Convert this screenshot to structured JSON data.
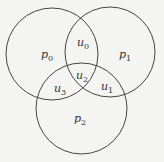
{
  "diagram": {
    "type": "venn",
    "stroke_color": "#444444",
    "background": "#f4f4f2",
    "circles": [
      {
        "name": "left",
        "cx": 52,
        "cy": 54,
        "r": 46
      },
      {
        "name": "right",
        "cx": 110,
        "cy": 52,
        "r": 45
      },
      {
        "name": "bottom",
        "cx": 81.5,
        "cy": 108.5,
        "r": 45.5
      }
    ],
    "labels": [
      {
        "id": "p0",
        "base": "p",
        "sub": "0",
        "x": 47,
        "y": 56
      },
      {
        "id": "u0",
        "base": "u",
        "sub": "0",
        "x": 83,
        "y": 44
      },
      {
        "id": "p1",
        "base": "p",
        "sub": "1",
        "x": 125,
        "y": 56
      },
      {
        "id": "u2",
        "base": "u",
        "sub": "2",
        "x": 82,
        "y": 77
      },
      {
        "id": "u3",
        "base": "u",
        "sub": "3",
        "x": 60,
        "y": 90
      },
      {
        "id": "u1",
        "base": "u",
        "sub": "1",
        "x": 107,
        "y": 88
      },
      {
        "id": "p2",
        "base": "p",
        "sub": "2",
        "x": 80,
        "y": 120
      }
    ]
  }
}
